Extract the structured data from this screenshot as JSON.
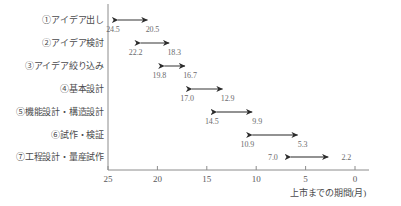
{
  "chart_data": {
    "type": "bar",
    "title": "",
    "xlabel": "上市までの期間(月)",
    "ylabel": "",
    "orientation": "horizontal",
    "x_axis_reversed": true,
    "xlim": [
      25,
      0
    ],
    "xticks": [
      25,
      20,
      15,
      10,
      5,
      0
    ],
    "xtick_labels": [
      "25",
      "20",
      "15",
      "10",
      "5",
      "0"
    ],
    "grid": false,
    "legend": "none",
    "categories": [
      "①アイデア出し",
      "②アイデア検討",
      "③アイデア絞り込み",
      "④基本設計",
      "⑤機能設計・構造設計",
      "⑥試作・検証",
      "⑦工程設計・量産試作"
    ],
    "series": [
      {
        "name": "開始(月)",
        "values": [
          24.5,
          22.2,
          19.8,
          17.0,
          14.5,
          10.9,
          7.0
        ]
      },
      {
        "name": "終了(月)",
        "values": [
          20.5,
          18.3,
          16.7,
          12.9,
          9.9,
          5.3,
          2.2
        ]
      }
    ],
    "bars": [
      {
        "category": "①アイデア出し",
        "start": 24.5,
        "end": 20.5,
        "start_label": "24.5",
        "end_label": "20.5",
        "label_position": "below"
      },
      {
        "category": "②アイデア検討",
        "start": 22.2,
        "end": 18.3,
        "start_label": "22.2",
        "end_label": "18.3",
        "label_position": "below"
      },
      {
        "category": "③アイデア絞り込み",
        "start": 19.8,
        "end": 16.7,
        "start_label": "19.8",
        "end_label": "16.7",
        "label_position": "below"
      },
      {
        "category": "④基本設計",
        "start": 17.0,
        "end": 12.9,
        "start_label": "17.0",
        "end_label": "12.9",
        "label_position": "below"
      },
      {
        "category": "⑤機能設計・構造設計",
        "start": 14.5,
        "end": 9.9,
        "start_label": "14.5",
        "end_label": "9.9",
        "label_position": "below"
      },
      {
        "category": "⑥試作・検証",
        "start": 10.9,
        "end": 5.3,
        "start_label": "10.9",
        "end_label": "5.3",
        "label_position": "below"
      },
      {
        "category": "⑦工程設計・量産試作",
        "start": 7.0,
        "end": 2.2,
        "start_label": "7.0",
        "end_label": "2.2",
        "label_position": "inline"
      }
    ],
    "colors": {
      "arrow_shaft": "#6e6e6e",
      "arrow_head": "#2b2b2b",
      "axis": "#8c8c8c",
      "text": "#59595b",
      "background": "#ffffff"
    }
  }
}
